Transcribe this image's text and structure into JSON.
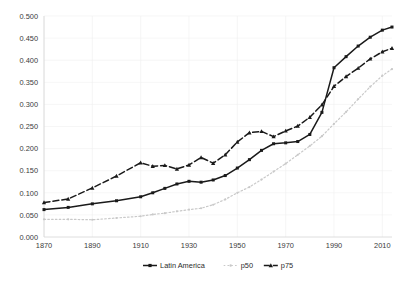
{
  "chart_data": {
    "type": "line",
    "title": "",
    "subtitle": "",
    "xlabel": "",
    "ylabel": "",
    "xlim": [
      1870,
      2014
    ],
    "ylim": [
      0.0,
      0.5
    ],
    "grid": true,
    "legend_position": "bottom",
    "x_ticks": [
      "1870",
      "1890",
      "1910",
      "1930",
      "1950",
      "1970",
      "1990",
      "2010"
    ],
    "x_tick_values": [
      1870,
      1890,
      1910,
      1930,
      1950,
      1970,
      1990,
      2010
    ],
    "y_ticks": [
      "0.000",
      "0.050",
      "0.100",
      "0.150",
      "0.200",
      "0.250",
      "0.300",
      "0.350",
      "0.400",
      "0.450",
      "0.500"
    ],
    "y_tick_values": [
      0.0,
      0.05,
      0.1,
      0.15,
      0.2,
      0.25,
      0.3,
      0.35,
      0.4,
      0.45,
      0.5
    ],
    "x": [
      1870,
      1880,
      1890,
      1900,
      1910,
      1915,
      1920,
      1925,
      1930,
      1935,
      1940,
      1945,
      1950,
      1955,
      1960,
      1965,
      1970,
      1975,
      1980,
      1985,
      1990,
      1995,
      2000,
      2005,
      2010,
      2014
    ],
    "series": [
      {
        "name": "Latin America",
        "style": "solid",
        "color": "#1a1a1a",
        "marker": "square",
        "values": [
          0.062,
          0.067,
          0.075,
          0.082,
          0.091,
          0.1,
          0.11,
          0.12,
          0.126,
          0.124,
          0.129,
          0.139,
          0.156,
          0.175,
          0.196,
          0.211,
          0.213,
          0.216,
          0.232,
          0.282,
          0.383,
          0.408,
          0.432,
          0.452,
          0.468,
          0.475
        ]
      },
      {
        "name": "p50",
        "style": "dotted",
        "color": "#c9c9c9",
        "marker": "dot",
        "values": [
          0.04,
          0.04,
          0.039,
          0.043,
          0.047,
          0.051,
          0.054,
          0.058,
          0.062,
          0.065,
          0.073,
          0.085,
          0.1,
          0.113,
          0.13,
          0.148,
          0.166,
          0.186,
          0.206,
          0.228,
          0.256,
          0.283,
          0.312,
          0.34,
          0.365,
          0.38
        ]
      },
      {
        "name": "p75",
        "style": "dashed",
        "color": "#1a1a1a",
        "marker": "triangle",
        "values": [
          0.078,
          0.086,
          0.111,
          0.138,
          0.168,
          0.16,
          0.162,
          0.154,
          0.163,
          0.18,
          0.167,
          0.186,
          0.215,
          0.236,
          0.239,
          0.227,
          0.24,
          0.251,
          0.271,
          0.299,
          0.341,
          0.363,
          0.382,
          0.403,
          0.419,
          0.427
        ]
      }
    ]
  },
  "legend": {
    "items": [
      {
        "label": "Latin America"
      },
      {
        "label": "p50"
      },
      {
        "label": "p75"
      }
    ]
  }
}
